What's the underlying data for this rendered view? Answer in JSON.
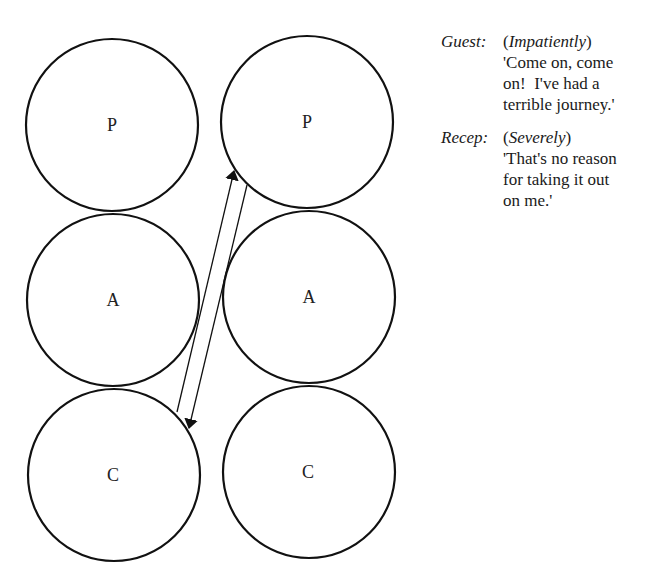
{
  "diagram": {
    "stroke_color": "#111111",
    "columns": [
      {
        "id": "left",
        "circles": [
          {
            "label": "P",
            "cx": 112,
            "cy": 125,
            "r": 86
          },
          {
            "label": "A",
            "cx": 113,
            "cy": 300,
            "r": 86
          },
          {
            "label": "C",
            "cx": 114,
            "cy": 475,
            "r": 86
          }
        ]
      },
      {
        "id": "right",
        "circles": [
          {
            "label": "P",
            "cx": 307,
            "cy": 122,
            "r": 86
          },
          {
            "label": "A",
            "cx": 309,
            "cy": 297,
            "r": 86
          },
          {
            "label": "C",
            "cx": 309,
            "cy": 472,
            "r": 86
          }
        ]
      }
    ],
    "arrows": [
      {
        "from": "left.C",
        "to": "right.P",
        "x1": 177,
        "y1": 412,
        "x2": 234,
        "y2": 171
      },
      {
        "from": "right.P",
        "to": "left.C",
        "x1": 247,
        "y1": 185,
        "x2": 189,
        "y2": 428
      }
    ]
  },
  "dialogue": [
    {
      "speaker": "Guest:",
      "direction": "Impatiently",
      "lines": [
        "'Come on, come",
        "on!  I've had a",
        "terrible journey.'"
      ]
    },
    {
      "speaker": "Recep:",
      "direction": "Severely",
      "lines": [
        "'That's no reason",
        "for taking it out",
        "on me.'"
      ]
    }
  ]
}
